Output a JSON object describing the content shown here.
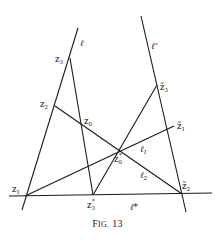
{
  "figure": {
    "caption_prefix": "F",
    "caption_smallcaps": "IG.",
    "caption_number": "13",
    "caption_full": "Fig. 13"
  },
  "lines": {
    "l": {
      "label": "ℓ",
      "from": [
        78,
        28
      ],
      "to": [
        22,
        210
      ]
    },
    "l_tilde": {
      "label": "ℓ̃",
      "from": [
        141,
        16
      ],
      "to": [
        186,
        212
      ]
    },
    "l_star": {
      "label": "ℓ*",
      "from": [
        9,
        196
      ],
      "to": [
        212,
        193
      ]
    },
    "l1": {
      "label": "ℓ₁",
      "from": [
        25,
        196
      ],
      "to": [
        174,
        126
      ]
    },
    "l2": {
      "label": "ℓ₂",
      "from": [
        55,
        106
      ],
      "to": [
        182,
        194
      ]
    },
    "z3_z3star": {
      "from": [
        70,
        58
      ],
      "to": [
        93,
        195
      ]
    },
    "z3star_z3tilde": {
      "from": [
        93,
        195
      ],
      "to": [
        157,
        85
      ]
    }
  },
  "points": {
    "z1": {
      "label": "z",
      "sub": "1",
      "pos": [
        25,
        196
      ]
    },
    "z2": {
      "label": "z",
      "sub": "2",
      "pos": [
        55,
        106
      ]
    },
    "z3": {
      "label": "z",
      "sub": "3",
      "pos": [
        70,
        58
      ]
    },
    "z0": {
      "label": "z",
      "sub": "0",
      "pos": [
        82,
        124
      ]
    },
    "z0_star": {
      "label": "z",
      "sub": "0",
      "sup": "*",
      "pos": [
        120,
        150
      ]
    },
    "z3_star": {
      "label": "z",
      "sub": "3",
      "sup": "*",
      "pos": [
        93,
        195
      ]
    },
    "z1_tilde": {
      "label": "z̃",
      "sub": "1",
      "pos": [
        174,
        126
      ]
    },
    "z2_tilde": {
      "label": "z̃",
      "sub": "2",
      "pos": [
        182,
        194
      ]
    },
    "z3_tilde": {
      "label": "z̃",
      "sub": "3",
      "pos": [
        157,
        85
      ]
    }
  },
  "labels": {
    "l": "ℓ",
    "l_tilde": "ℓ̃",
    "l_star": "ℓ*",
    "l1": "ℓ",
    "l1_sub": "1",
    "l2": "ℓ",
    "l2_sub": "2",
    "z1": "z",
    "z1_sub": "1",
    "z2": "z",
    "z2_sub": "2",
    "z3": "z",
    "z3_sub": "3",
    "z0": "z",
    "z0_sub": "0",
    "z0s": "z",
    "z0s_sub": "0",
    "z0s_sup": "*",
    "z3s": "z",
    "z3s_sub": "3",
    "z3s_sup": "*",
    "zt1": "z̃",
    "zt1_sub": "1",
    "zt2": "z̃",
    "zt2_sub": "2",
    "zt3": "z̃",
    "zt3_sub": "3"
  }
}
